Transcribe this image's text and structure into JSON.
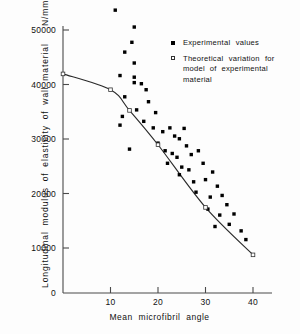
{
  "chart_data": {
    "type": "scatter",
    "title": "",
    "xlabel": "Mean  microfibril  angle",
    "ylabel": "Longitudinal  modulus  of  elasticity  of  wall  material",
    "ylabel_units": "N/mm",
    "ylabel_units_exponent": "2",
    "xlim": [
      0,
      42
    ],
    "ylim": [
      0,
      52000
    ],
    "xticks": [
      10,
      20,
      30,
      40
    ],
    "xtick_labels": [
      "10",
      "20",
      "30",
      "40"
    ],
    "yticks": [
      0,
      10000,
      20000,
      30000,
      40000,
      50000
    ],
    "ytick_labels": [
      "0",
      "10000",
      "20000",
      "30000",
      "40000",
      "50000"
    ],
    "grid": false,
    "legend_position": "top-right",
    "series": [
      {
        "name": "Experimental values",
        "marker": "filled-square",
        "color": "#000000",
        "points": [
          [
            11.0,
            51900
          ],
          [
            15.0,
            48800
          ],
          [
            14.5,
            46000
          ],
          [
            13.0,
            44200
          ],
          [
            15.0,
            42200
          ],
          [
            12.0,
            39900
          ],
          [
            15.0,
            39600
          ],
          [
            15.0,
            38600
          ],
          [
            16.5,
            38400
          ],
          [
            17.5,
            37300
          ],
          [
            13.0,
            36000
          ],
          [
            18.0,
            35100
          ],
          [
            15.5,
            33600
          ],
          [
            12.5,
            32400
          ],
          [
            12.0,
            30800
          ],
          [
            19.5,
            33100
          ],
          [
            17.0,
            31500
          ],
          [
            19.0,
            30300
          ],
          [
            21.0,
            29600
          ],
          [
            22.5,
            30300
          ],
          [
            23.5,
            28800
          ],
          [
            20.0,
            27500
          ],
          [
            24.5,
            28300
          ],
          [
            25.5,
            30200
          ],
          [
            14.0,
            26400
          ],
          [
            21.5,
            26100
          ],
          [
            23.0,
            25600
          ],
          [
            24.0,
            24900
          ],
          [
            26.0,
            27000
          ],
          [
            22.0,
            23800
          ],
          [
            25.0,
            23100
          ],
          [
            27.0,
            25400
          ],
          [
            28.5,
            26100
          ],
          [
            26.5,
            22600
          ],
          [
            24.5,
            21700
          ],
          [
            29.5,
            23800
          ],
          [
            31.5,
            22200
          ],
          [
            27.5,
            20400
          ],
          [
            30.0,
            20800
          ],
          [
            32.5,
            19600
          ],
          [
            28.0,
            18500
          ],
          [
            31.0,
            17600
          ],
          [
            33.5,
            17900
          ],
          [
            34.5,
            16200
          ],
          [
            30.5,
            15400
          ],
          [
            33.0,
            14300
          ],
          [
            36.0,
            14500
          ],
          [
            35.0,
            12600
          ],
          [
            32.0,
            12200
          ],
          [
            37.5,
            11400
          ],
          [
            38.5,
            9800
          ]
        ]
      },
      {
        "name": "Theoretical variation for model of experimental material",
        "marker": "open-square",
        "color": "#333333",
        "curve": true,
        "points": [
          [
            0.0,
            40200
          ],
          [
            10.0,
            37300
          ],
          [
            14.0,
            33500
          ],
          [
            20.0,
            27200
          ],
          [
            30.0,
            15700
          ],
          [
            40.0,
            7000
          ]
        ]
      }
    ]
  },
  "legend": {
    "items": [
      {
        "marker": "filled-square",
        "label": "Experimental    values",
        "label2": "",
        "label3": ""
      },
      {
        "marker": "open-square",
        "label": "Theoretical    variation    for",
        "label2": "model   of   experimental",
        "label3": "material"
      }
    ]
  },
  "axes": {
    "x_title": "Mean    microfibril    angle",
    "y_title": "Longitudinal   modulus   of   elasticity   of   wall   material",
    "y_units_base": "N/mm",
    "y_units_sup": "2"
  }
}
